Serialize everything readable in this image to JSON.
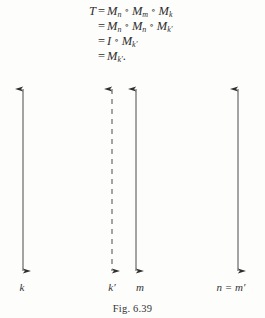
{
  "figure": {
    "caption": "Fig. 6.39",
    "ink_color": "#333333",
    "background_color": "#fdfdfc"
  },
  "derivation": {
    "lines": [
      {
        "lhs": "T",
        "relation": "=",
        "terms": [
          "M",
          "M",
          "M"
        ],
        "subscripts": [
          "n",
          "m",
          "k"
        ],
        "operator": "∘",
        "trailing": ""
      },
      {
        "lhs": "",
        "relation": "=",
        "terms": [
          "M",
          "M",
          "M"
        ],
        "subscripts": [
          "n",
          "n",
          "k′"
        ],
        "operator": "∘",
        "trailing": ""
      },
      {
        "lhs": "",
        "relation": "=",
        "terms": [
          "I",
          "M"
        ],
        "subscripts": [
          "",
          "k′"
        ],
        "operator": "∘",
        "trailing": ""
      },
      {
        "lhs": "",
        "relation": "=",
        "terms": [
          "M"
        ],
        "subscripts": [
          "k′"
        ],
        "operator": "",
        "trailing": "."
      }
    ],
    "line_1_text": "T = Mₙ ∘ Mₘ ∘ Mₖ",
    "line_2_text": "= Mₙ ∘ Mₙ ∘ Mₖ′",
    "line_3_text": "= I ∘ Mₖ′",
    "line_4_text": "= Mₖ′."
  },
  "axes": [
    {
      "id": "axis-k",
      "label": "k",
      "x": 23,
      "style": "solid",
      "label_x": 22
    },
    {
      "id": "axis-kp",
      "label": "k′",
      "x": 112,
      "style": "dashed",
      "label_x": 112
    },
    {
      "id": "axis-m",
      "label": "m",
      "x": 136,
      "style": "solid",
      "label_x": 140
    },
    {
      "id": "axis-nmp",
      "label": "n = m′",
      "x": 238,
      "style": "solid",
      "label_x": 231
    }
  ],
  "geometry": {
    "arrow_top_y": 88,
    "arrow_bottom_y": 272,
    "label_baseline_y": 284
  }
}
